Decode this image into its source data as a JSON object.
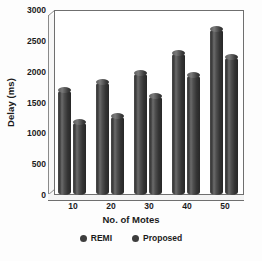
{
  "chart_data": {
    "type": "bar",
    "title": "",
    "xlabel": "No. of Motes",
    "ylabel": "Delay (ms)",
    "categories": [
      "10",
      "20",
      "30",
      "40",
      "50"
    ],
    "series": [
      {
        "name": "REMI",
        "values": [
          1700,
          1830,
          1980,
          2300,
          2700
        ],
        "color": "#3d3d3d"
      },
      {
        "name": "Proposed",
        "values": [
          1180,
          1280,
          1600,
          1950,
          2230
        ],
        "color": "#3d3d3d"
      }
    ],
    "ylim": [
      0,
      3000
    ],
    "ytick_labels": [
      "0",
      "500",
      "1000",
      "1500",
      "2000",
      "2500",
      "3000"
    ],
    "ytick_values": [
      0,
      500,
      1000,
      1500,
      2000,
      2500,
      3000
    ],
    "grid": false,
    "legend_position": "bottom",
    "style": "3d-cylinder"
  },
  "legend": {
    "items": [
      {
        "label": "REMI",
        "marker": "circle-marker-icon"
      },
      {
        "label": "Proposed",
        "marker": "circle-marker-icon"
      }
    ]
  }
}
